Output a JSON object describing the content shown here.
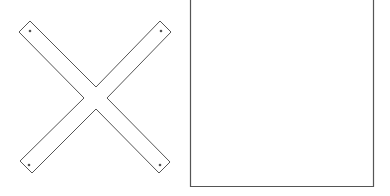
{
  "figure": {
    "width": 390,
    "height": 196,
    "background": "#ffffff",
    "stroke_color": "#555555",
    "cross": {
      "description": "X-shaped cross brace made of two flat strips with holes near the ends",
      "strip_a": {
        "x1": 26,
        "y1": 26,
        "x2": 165,
        "y2": 165
      },
      "strip_b": {
        "x1": 165,
        "y1": 26,
        "x2": 26,
        "y2": 165
      },
      "strip_width": 16,
      "holes": [
        {
          "cx": 30,
          "cy": 31
        },
        {
          "cx": 161,
          "cy": 31
        },
        {
          "cx": 29,
          "cy": 165
        },
        {
          "cx": 160,
          "cy": 165
        }
      ]
    },
    "panel": {
      "description": "Square panel outline open at the top edge",
      "left": 190,
      "right": 373,
      "top": 0,
      "bottom": 186
    }
  }
}
